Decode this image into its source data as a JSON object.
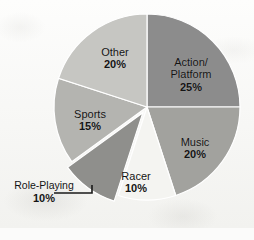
{
  "title": {
    "text": "in United States",
    "cropped": true
  },
  "chart_data": {
    "type": "pie",
    "title": "in United States",
    "xlabel": "",
    "ylabel": "",
    "grid": false,
    "legend": "none",
    "value_unit": "percent",
    "start_angle_deg": 0,
    "direction": "clockwise",
    "center": {
      "x": 147,
      "y": 107
    },
    "radius": 93,
    "categories": [
      "Action/Platform",
      "Music",
      "Racer",
      "Role-Playing",
      "Sports",
      "Other"
    ],
    "values": [
      25,
      20,
      10,
      10,
      15,
      20
    ],
    "slices": [
      {
        "name": "Action/Platform",
        "label_line1": "Action/",
        "label_line2": "Platform",
        "value": 25,
        "value_label": "25%",
        "color": "#8c8c8c",
        "exploded": false,
        "label_position": "inside"
      },
      {
        "name": "Music",
        "label_line1": "Music",
        "label_line2": "",
        "value": 20,
        "value_label": "20%",
        "color": "#a2a29e",
        "exploded": false,
        "label_position": "inside"
      },
      {
        "name": "Racer",
        "label_line1": "Racer",
        "label_line2": "",
        "value": 10,
        "value_label": "10%",
        "color": "#f4f4f1",
        "exploded": false,
        "label_position": "inside"
      },
      {
        "name": "Role-Playing",
        "label_line1": "Role-Playing",
        "label_line2": "",
        "value": 10,
        "value_label": "10%",
        "color": "#8f8f8c",
        "exploded": true,
        "label_position": "outside"
      },
      {
        "name": "Sports",
        "label_line1": "Sports",
        "label_line2": "",
        "value": 15,
        "value_label": "15%",
        "color": "#b4b4b0",
        "exploded": false,
        "label_position": "inside"
      },
      {
        "name": "Other",
        "label_line1": "Other",
        "label_line2": "",
        "value": 20,
        "value_label": "20%",
        "color": "#c6c6c2",
        "exploded": false,
        "label_position": "inside"
      }
    ],
    "colors": {
      "background": "#fbfbfa",
      "text": "#141414",
      "slice_edge": "#ffffff",
      "leader_line": "#1a1a1a"
    }
  }
}
